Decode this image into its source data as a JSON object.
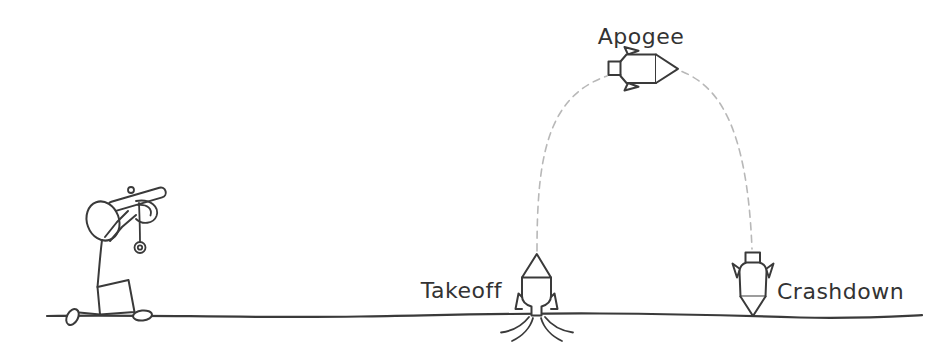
{
  "colors": {
    "background": "#ffffff",
    "ink": "#3a3a3a",
    "text": "#333333",
    "dash": "#b8b8b8"
  },
  "stages": [
    {
      "id": "takeoff",
      "label": "Takeoff",
      "icon": "rocket-launching-icon",
      "position": "ground-left"
    },
    {
      "id": "apogee",
      "label": "Apogee",
      "icon": "rocket-horizontal-icon",
      "position": "top-center"
    },
    {
      "id": "crashdown",
      "label": "Crashdown",
      "icon": "rocket-nose-down-icon",
      "position": "ground-right"
    }
  ],
  "observer": {
    "icon": "kneeling-figure-with-launcher-icon",
    "pose": "kneeling, aiming tube upward, pull-ring dangling"
  },
  "trajectory": {
    "style": "dashed-arc",
    "shape": "dome from takeoff up to apogee and down to crashdown"
  },
  "ground": {
    "style": "hand-drawn-horizontal-line"
  }
}
